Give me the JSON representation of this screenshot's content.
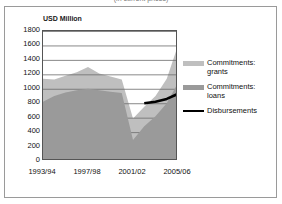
{
  "figure": {
    "top_caption": "(in current prices)",
    "frame_border_color": "#9a9a9a",
    "background": "#ffffff"
  },
  "axis_title": "USD Million",
  "legend": {
    "items": [
      {
        "label": "Commitments:\ngrants",
        "color": "#bfbfbf",
        "marker": "swatch",
        "name": "commitments-grants"
      },
      {
        "label": "Commitments:\nloans",
        "color": "#9a9a9a",
        "marker": "swatch",
        "name": "commitments-loans"
      },
      {
        "label": "Disbursements",
        "color": "#000000",
        "marker": "line",
        "name": "disbursements"
      }
    ]
  },
  "chart_data": {
    "type": "area",
    "title": "",
    "subtitle": "",
    "xlabel": "",
    "ylabel": "USD Million",
    "ylim": [
      0,
      1800
    ],
    "ytick_step": 200,
    "yticks": [
      1800,
      1600,
      1400,
      1200,
      1000,
      800,
      600,
      400,
      200,
      0
    ],
    "grid": true,
    "legend_position": "right",
    "x": [
      "1993/94",
      "1994/95",
      "1995/96",
      "1996/97",
      "1997/98",
      "1998/99",
      "1999/00",
      "2000/01",
      "2001/02",
      "2002/03",
      "2003/04",
      "2004/05",
      "2005/06"
    ],
    "xtick_labels": [
      "1993/94",
      "1997/98",
      "2001/02",
      "2005/06"
    ],
    "xtick_positions": [
      0,
      4,
      8,
      12
    ],
    "stacked": true,
    "series": [
      {
        "name": "Commitments: loans",
        "color": "#9a9a9a",
        "type": "area",
        "values": [
          820,
          900,
          950,
          980,
          1000,
          980,
          960,
          940,
          290,
          480,
          620,
          800,
          1080
        ]
      },
      {
        "name": "Commitments: grants",
        "color": "#bfbfbf",
        "type": "area",
        "values": [
          320,
          230,
          230,
          250,
          300,
          230,
          210,
          190,
          300,
          270,
          280,
          340,
          520
        ]
      },
      {
        "name": "Disbursements",
        "color": "#000000",
        "type": "line",
        "x": [
          "2002/03",
          "2003/04",
          "2004/05",
          "2005/06"
        ],
        "values": [
          800,
          820,
          860,
          930
        ]
      }
    ],
    "stacked_totals": [
      1140,
      1130,
      1180,
      1230,
      1300,
      1210,
      1170,
      1130,
      590,
      750,
      900,
      1140,
      1600
    ],
    "annotations": []
  }
}
